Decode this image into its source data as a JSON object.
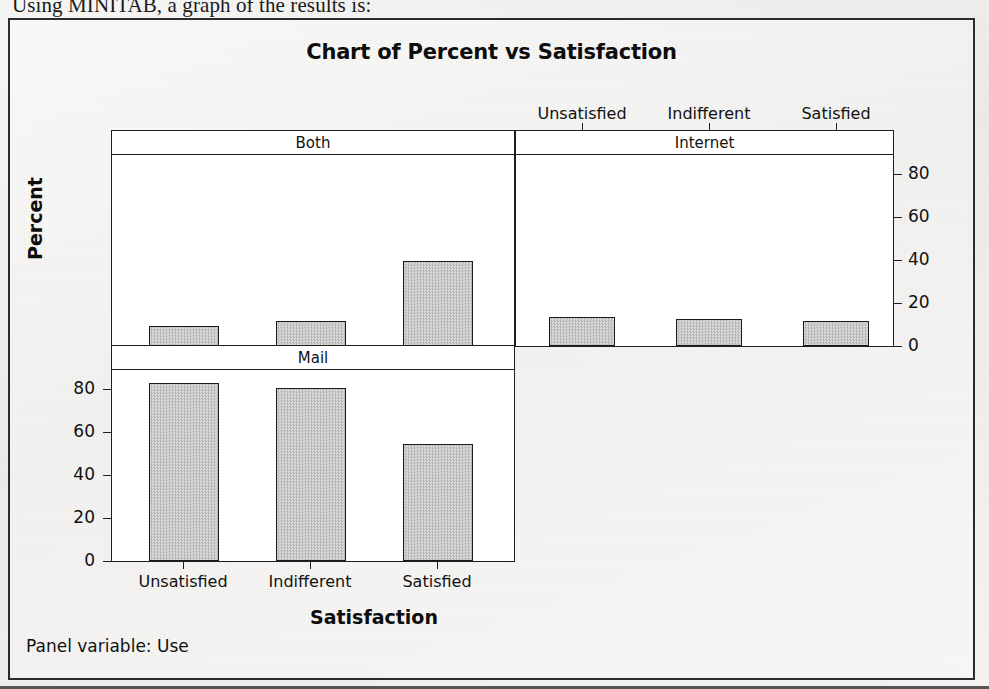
{
  "page": {
    "body_text_clipped": "Using MINITAB, a graph of the results is:"
  },
  "figure": {
    "title": "Chart of Percent vs Satisfaction",
    "footer_note": "Panel variable: Use",
    "axis": {
      "y_title": "Percent",
      "x_title": "Satisfaction",
      "y_ticks": [
        "0",
        "20",
        "40",
        "60",
        "80"
      ],
      "y_ticks_right": [
        "0",
        "20",
        "40",
        "60",
        "80"
      ]
    },
    "panels": [
      {
        "name": "Both",
        "position": "top-left"
      },
      {
        "name": "Internet",
        "position": "top-right"
      },
      {
        "name": "Mail",
        "position": "bottom-left"
      }
    ],
    "categories": [
      "Unsatisfied",
      "Indifferent",
      "Satisfied"
    ],
    "colors": {
      "bar_fill": "#d0d0d0",
      "bar_edge": "#1b1b1b",
      "frame": "#2b2b2b",
      "text": "#101010",
      "panel_bg": "#ffffff"
    }
  },
  "chart_data": {
    "type": "bar",
    "title": "Chart of Percent vs Satisfaction",
    "xlabel": "Satisfaction",
    "ylabel": "Percent",
    "ylim": [
      0,
      85
    ],
    "grid": false,
    "legend": "none",
    "panel_variable": "Use",
    "categories": [
      "Unsatisfied",
      "Indifferent",
      "Satisfied"
    ],
    "panels": [
      {
        "name": "Both",
        "values": [
          9,
          11,
          38
        ]
      },
      {
        "name": "Internet",
        "values": [
          13,
          12,
          11
        ]
      },
      {
        "name": "Mail",
        "values": [
          79,
          77,
          52
        ]
      }
    ],
    "annotations": [
      "Panel variable: Use"
    ]
  }
}
